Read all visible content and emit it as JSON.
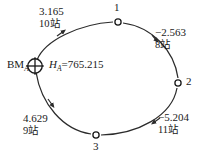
{
  "diagram": {
    "benchmark": {
      "name": "BM",
      "subscript": "A",
      "symbol": "benchmark-circle-cross",
      "height_label_prefix": "H",
      "height_label_subscript": "A",
      "height_equals": "=765.215",
      "height_full": "H_A=765.215"
    },
    "nodes": [
      {
        "id": "1",
        "label": "1"
      },
      {
        "id": "2",
        "label": "2"
      },
      {
        "id": "3",
        "label": "3"
      }
    ],
    "segments": [
      {
        "id": "bm-to-1",
        "elevation_diff": "3.165",
        "stations": "10站",
        "direction": "forward"
      },
      {
        "id": "1-to-2",
        "elevation_diff": "−2.563",
        "stations": "8站",
        "direction": "forward"
      },
      {
        "id": "2-to-3",
        "elevation_diff": "−5.204",
        "stations": "11站",
        "direction": "forward"
      },
      {
        "id": "3-to-bm",
        "elevation_diff": "4.629",
        "stations": "9站",
        "direction": "forward"
      }
    ],
    "colors": {
      "line": "#2b2b2b",
      "text": "#1a1a1a",
      "background": "#ffffff"
    }
  }
}
